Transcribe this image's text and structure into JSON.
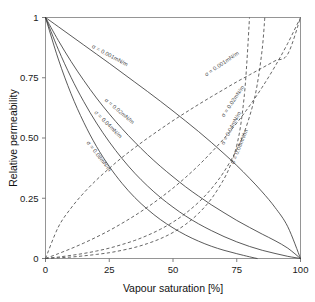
{
  "chart_data": {
    "type": "line",
    "title": "",
    "xlabel": "Vapour saturation [%]",
    "ylabel": "Relative permeability",
    "xlim": [
      0,
      100
    ],
    "ylim": [
      0,
      1
    ],
    "xticks": [
      "0",
      "25",
      "50",
      "75",
      "100"
    ],
    "xtick_values": [
      0,
      25,
      50,
      75,
      100
    ],
    "yticks": [
      "0",
      "0.25",
      "0.50",
      "0.75",
      "1"
    ],
    "ytick_values": [
      0,
      0.25,
      0.5,
      0.75,
      1
    ],
    "grid": false,
    "legend_position": "inline-annotations",
    "series": [
      {
        "name": "σ = 0.001mN/m",
        "style": "solid",
        "group": "liquid",
        "x": [
          0,
          5,
          10,
          15,
          20,
          25,
          30,
          35,
          40,
          45,
          50,
          55,
          60,
          65,
          70,
          75,
          80,
          85,
          90,
          95,
          100
        ],
        "values": [
          1.0,
          0.962,
          0.924,
          0.886,
          0.848,
          0.81,
          0.771,
          0.732,
          0.693,
          0.653,
          0.612,
          0.57,
          0.527,
          0.482,
          0.435,
          0.386,
          0.333,
          0.276,
          0.212,
          0.132,
          0.0
        ]
      },
      {
        "name": "σ = 0.02mN/m",
        "style": "solid",
        "group": "liquid",
        "x": [
          0,
          5,
          10,
          15,
          20,
          25,
          30,
          35,
          40,
          45,
          50,
          55,
          60,
          65,
          70,
          75,
          80,
          85,
          90,
          95,
          100
        ],
        "values": [
          1.0,
          0.905,
          0.818,
          0.739,
          0.666,
          0.6,
          0.539,
          0.483,
          0.431,
          0.383,
          0.339,
          0.297,
          0.259,
          0.223,
          0.19,
          0.158,
          0.129,
          0.101,
          0.074,
          0.043,
          0.0
        ]
      },
      {
        "name": "σ = 0.04mN/m",
        "style": "solid",
        "group": "liquid",
        "x": [
          0,
          5,
          10,
          15,
          20,
          25,
          30,
          35,
          40,
          45,
          50,
          55,
          60,
          65,
          70,
          75,
          80,
          85,
          90,
          95,
          100
        ],
        "values": [
          1.0,
          0.868,
          0.752,
          0.651,
          0.562,
          0.484,
          0.415,
          0.354,
          0.301,
          0.254,
          0.213,
          0.176,
          0.144,
          0.116,
          0.091,
          0.069,
          0.05,
          0.034,
          0.021,
          0.009,
          0.0
        ]
      },
      {
        "name": "σ = 0.08mN/m",
        "style": "solid",
        "group": "liquid",
        "x": [
          0,
          5,
          10,
          15,
          20,
          25,
          30,
          35,
          40,
          45,
          50,
          55,
          60,
          65,
          70,
          75,
          80,
          83
        ],
        "values": [
          1.0,
          0.828,
          0.684,
          0.565,
          0.465,
          0.382,
          0.312,
          0.253,
          0.204,
          0.162,
          0.127,
          0.097,
          0.072,
          0.051,
          0.034,
          0.02,
          0.007,
          0.0
        ]
      },
      {
        "name": "σ = 0.001mN/m",
        "style": "dashed",
        "group": "vapour",
        "x": [
          0,
          5,
          10,
          15,
          20,
          25,
          30,
          35,
          40,
          45,
          50,
          55,
          60,
          65,
          70,
          75,
          80,
          85,
          90,
          95,
          100
        ],
        "values": [
          0.0,
          0.13,
          0.209,
          0.272,
          0.326,
          0.374,
          0.419,
          0.46,
          0.499,
          0.536,
          0.572,
          0.606,
          0.639,
          0.671,
          0.702,
          0.733,
          0.762,
          0.791,
          0.82,
          0.848,
          1.0
        ]
      },
      {
        "name": "σ = 0.02mN/m",
        "style": "dashed",
        "group": "vapour",
        "x": [
          0,
          5,
          10,
          15,
          20,
          25,
          30,
          35,
          40,
          45,
          50,
          55,
          60,
          65,
          70,
          75,
          80,
          85,
          90,
          95,
          100
        ],
        "values": [
          0.0,
          0.02,
          0.041,
          0.064,
          0.089,
          0.116,
          0.146,
          0.178,
          0.213,
          0.251,
          0.292,
          0.337,
          0.386,
          0.44,
          0.498,
          0.562,
          0.633,
          0.711,
          0.797,
          0.893,
          1.0
        ]
      },
      {
        "name": "σ = 0.04mN/m",
        "style": "dashed",
        "group": "vapour",
        "x": [
          0,
          5,
          10,
          15,
          20,
          25,
          30,
          35,
          40,
          45,
          50,
          55,
          60,
          65,
          70,
          75,
          78,
          81,
          83,
          85,
          86
        ],
        "values": [
          0.0,
          0.006,
          0.013,
          0.021,
          0.031,
          0.043,
          0.058,
          0.075,
          0.096,
          0.121,
          0.151,
          0.188,
          0.233,
          0.289,
          0.36,
          0.452,
          0.525,
          0.625,
          0.72,
          0.87,
          1.0
        ]
      },
      {
        "name": "σ = 0.08mN/m",
        "style": "dashed",
        "group": "vapour",
        "x": [
          0,
          5,
          10,
          15,
          20,
          25,
          30,
          35,
          40,
          45,
          50,
          55,
          60,
          65,
          70,
          73,
          75,
          76.5,
          78,
          79,
          80
        ],
        "values": [
          0.0,
          0.003,
          0.006,
          0.011,
          0.017,
          0.024,
          0.034,
          0.046,
          0.062,
          0.082,
          0.108,
          0.142,
          0.187,
          0.247,
          0.33,
          0.4,
          0.47,
          0.55,
          0.68,
          0.82,
          1.0
        ]
      }
    ],
    "annotations": [
      {
        "text": "σ = 0.001mN/m",
        "x": 18,
        "y": 0.875,
        "rotation": 28
      },
      {
        "text": "σ = 0.02mN/m",
        "x": 23,
        "y": 0.655,
        "rotation": 40
      },
      {
        "text": "σ = 0.04mN/m",
        "x": 19,
        "y": 0.605,
        "rotation": 45
      },
      {
        "text": "σ = 0.08mN/m",
        "x": 16,
        "y": 0.48,
        "rotation": 52
      },
      {
        "text": "σ = 0.001mN/m",
        "x": 63,
        "y": 0.755,
        "rotation": -34
      },
      {
        "text": "σ = 0.02mN/m",
        "x": 70,
        "y": 0.585,
        "rotation": -56
      },
      {
        "text": "σ = 0.04mN/m",
        "x": 70,
        "y": 0.47,
        "rotation": -62
      },
      {
        "text": "σ = 0.08mN/m",
        "x": 74,
        "y": 0.39,
        "rotation": -68
      }
    ]
  }
}
